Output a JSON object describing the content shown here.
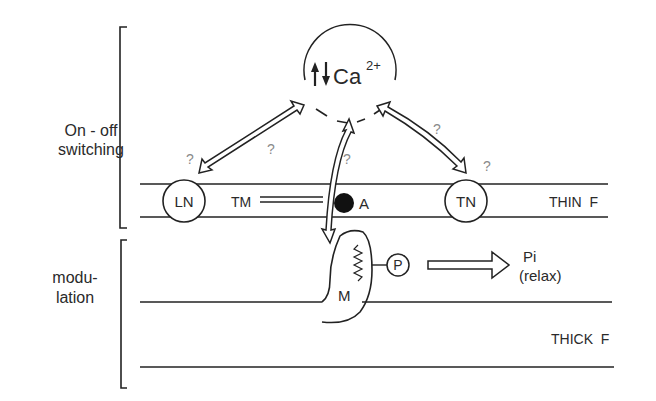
{
  "diagram": {
    "type": "schematic",
    "brackets": [
      {
        "id": "on-off",
        "label_lines": [
          "On - off",
          "switching"
        ]
      },
      {
        "id": "modulation",
        "label_lines": [
          "modu-",
          "lation"
        ]
      }
    ],
    "calcium_node": {
      "arrows_glyph": "↑↓",
      "label": "Ca",
      "superscript": "2+"
    },
    "thin_filament": {
      "label": "THIN  F",
      "nodes": {
        "ln": "LN",
        "tn": "TN",
        "tm": "TM",
        "a": "A"
      }
    },
    "thick_filament": {
      "label": "THICK  F"
    },
    "myosin": {
      "label": "M",
      "phosphate": "P",
      "product_line1": "Pi",
      "product_line2": "(relax)"
    },
    "question_marks": [
      "?",
      "?",
      "?",
      "?",
      "?"
    ],
    "edges": [
      {
        "from": "Ca2+",
        "to": "LN",
        "style": "double-headed hollow arrow",
        "label": "?"
      },
      {
        "from": "Ca2+",
        "to": "TN",
        "style": "double-headed hollow arrow",
        "label": "?"
      },
      {
        "from": "Ca2+",
        "to": "M",
        "style": "double-headed hollow arrow",
        "label": "?"
      },
      {
        "from": "P",
        "to": "Pi (relax)",
        "style": "hollow arrow"
      }
    ]
  }
}
